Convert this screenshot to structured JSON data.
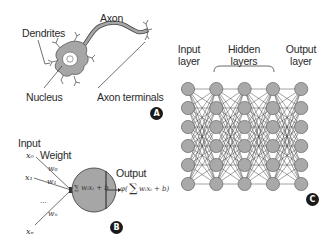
{
  "panel_a": {
    "title": "Biological neuron",
    "labels": {
      "dendrites": "Dendrites",
      "axon": "Axon",
      "nucleus": "Nucleus",
      "axon_terminals": "Axon terminals"
    },
    "badge": "A"
  },
  "panel_b": {
    "title": "Artificial neuron (perceptron)",
    "labels": {
      "input": "Input",
      "weight": "Weight",
      "output": "Output"
    },
    "inputs": [
      "x₀",
      "x₁",
      "...",
      "xₙ"
    ],
    "weights": [
      "w₀",
      "w₁",
      "wₙ"
    ],
    "sum_expr": "∑ wᵢxᵢ + b",
    "sum_index": "i",
    "output_expr_prefix": "φ(",
    "output_expr_sum": "∑",
    "output_expr_body": " wᵢxᵢ + b)",
    "badge": "B"
  },
  "panel_c": {
    "title": "Deep neural network",
    "labels": {
      "input_layer_line1": "Input",
      "input_layer_line2": "layer",
      "hidden_layers_line1": "Hidden",
      "hidden_layers_line2": "layers",
      "output_layer_line1": "Output",
      "output_layer_line2": "layer"
    },
    "layers": 5,
    "nodes_per_layer": 6,
    "node_color": "#a9a9a9",
    "badge": "C"
  },
  "colors": {
    "cell_fill": "#a6a6a6",
    "line": "#333333",
    "badge_bg": "#1a1a1a"
  }
}
